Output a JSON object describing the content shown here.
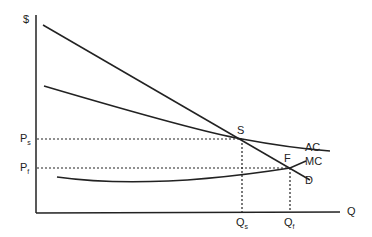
{
  "diagram": {
    "axes": {
      "y_label": "$",
      "x_label": "Q"
    },
    "curves": [
      {
        "id": "D",
        "label": "D"
      },
      {
        "id": "AC",
        "label": "AC"
      },
      {
        "id": "MC",
        "label": "MC"
      }
    ],
    "points": [
      {
        "id": "S",
        "label": "S"
      },
      {
        "id": "F",
        "label": "F"
      }
    ],
    "price_labels": [
      {
        "main": "P",
        "sub": "s"
      },
      {
        "main": "P",
        "sub": "f"
      }
    ],
    "quantity_labels": [
      {
        "main": "Q",
        "sub": "s"
      },
      {
        "main": "Q",
        "sub": "f"
      }
    ],
    "colors": {
      "line": "#222222",
      "background": "#ffffff"
    }
  }
}
